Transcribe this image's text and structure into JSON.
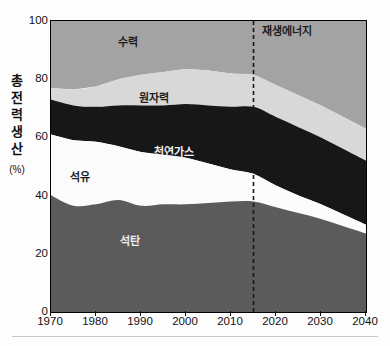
{
  "axis": {
    "y_title_chars": [
      "총",
      "전",
      "력",
      "생",
      "산"
    ],
    "y_unit": "(%)",
    "y_ticks": [
      "0",
      "20",
      "40",
      "60",
      "80",
      "100"
    ],
    "x_ticks": [
      "1970",
      "1980",
      "1990",
      "2000",
      "2010",
      "2020",
      "2030",
      "2040"
    ]
  },
  "series_labels": {
    "coal": "석탄",
    "oil": "석유",
    "gas": "천연가스",
    "nuclear": "원자력",
    "hydro": "수력",
    "renewable": "재생에너지"
  },
  "colors": {
    "coal": "#5b5b5b",
    "oil": "#fbfbfb",
    "gas": "#171717",
    "nuclear": "#d8d8d8",
    "hydro": "#a3a3a3",
    "renewable": "#a3a3a3",
    "axis": "#111111",
    "divider": "#1a1a1a"
  },
  "chart_data": {
    "type": "area",
    "title": "",
    "xlabel": "",
    "ylabel": "총전력생산 (%)",
    "xlim": [
      1970,
      2040
    ],
    "ylim": [
      0,
      100
    ],
    "grid": false,
    "legend": "inline-area-labels",
    "stacked": true,
    "stack_order_bottom_to_top": [
      "석탄",
      "석유",
      "천연가스",
      "원자력",
      "수력/재생에너지"
    ],
    "x": [
      1970,
      1975,
      1980,
      1985,
      1990,
      1995,
      2000,
      2005,
      2010,
      2015,
      2020,
      2025,
      2030,
      2035,
      2040
    ],
    "series": [
      {
        "name": "석탄",
        "values": [
          40,
          36.5,
          37,
          38.5,
          36.5,
          37,
          37,
          37.5,
          38,
          38,
          36,
          34,
          32,
          29.5,
          27
        ]
      },
      {
        "name": "석유",
        "values": [
          21,
          22.5,
          21.5,
          18.5,
          18.5,
          17,
          16,
          13.5,
          11,
          9.5,
          7.5,
          6,
          5,
          4,
          3
        ]
      },
      {
        "name": "천연가스",
        "values": [
          12,
          12,
          12,
          14,
          16,
          17,
          18.5,
          20,
          21.5,
          23,
          23.5,
          23.5,
          23,
          22.5,
          22
        ]
      },
      {
        "name": "원자력",
        "values": [
          4,
          5.5,
          7,
          9,
          10.5,
          11.5,
          12,
          12,
          11.5,
          11,
          11,
          11,
          11,
          11,
          11
        ]
      },
      {
        "name": "수력/재생에너지",
        "values": [
          23,
          23.5,
          22.5,
          20,
          18.5,
          17.5,
          16.5,
          17,
          18,
          18.5,
          22,
          25.5,
          29,
          33,
          37
        ]
      }
    ],
    "annotations": [
      {
        "type": "vline",
        "x": 2015,
        "style": "dashed",
        "meaning": "history / projection divider"
      }
    ]
  }
}
